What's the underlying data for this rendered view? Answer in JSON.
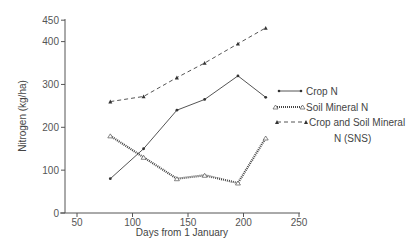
{
  "chart_data": {
    "type": "line",
    "title": "",
    "xlabel": "Days from 1 January",
    "ylabel": "Nitrogen (kg/ha)",
    "xlim": [
      40,
      250
    ],
    "ylim": [
      0,
      450
    ],
    "xticks": [
      50,
      100,
      150,
      200,
      250
    ],
    "yticks": [
      0,
      100,
      200,
      300,
      400,
      450
    ],
    "grid": false,
    "legend_position": "right",
    "series": [
      {
        "name": "Crop N",
        "style": "solid",
        "marker": "dot",
        "x": [
          80,
          110,
          140,
          165,
          195,
          220
        ],
        "values": [
          80,
          150,
          240,
          265,
          320,
          270
        ]
      },
      {
        "name": "Soil Mineral N",
        "style": "dotted",
        "marker": "open-triangle",
        "x": [
          80,
          110,
          140,
          165,
          195,
          220
        ],
        "values": [
          180,
          130,
          80,
          88,
          70,
          175
        ]
      },
      {
        "name": "Crop and Soil Mineral N (SNS)",
        "style": "dashed",
        "marker": "filled-triangle",
        "x": [
          80,
          110,
          140,
          165,
          195,
          220
        ],
        "values": [
          260,
          272,
          316,
          350,
          395,
          432
        ]
      }
    ]
  },
  "legend": {
    "items": [
      {
        "label": "Crop N"
      },
      {
        "label": "Soil Mineral N"
      },
      {
        "label_line1": "Crop and Soil Mineral",
        "label_line2": "N  (SNS)"
      }
    ]
  },
  "axes": {
    "x_title": "Days from 1 January",
    "y_title": "Nitrogen (kg/ha)",
    "x_tick_labels": [
      "50",
      "100",
      "150",
      "200",
      "250"
    ],
    "y_tick_labels": [
      "0",
      "100",
      "200",
      "300",
      "400",
      "450"
    ]
  }
}
